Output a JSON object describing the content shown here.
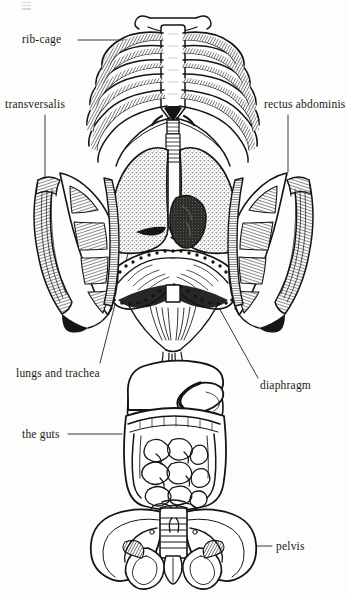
{
  "figure": {
    "kind": "anatomical-illustration",
    "background_color": "#fdfdfb",
    "ink_color": "#151513"
  },
  "labels": [
    {
      "id": "rib-cage",
      "text": "rib-cage",
      "x": 22,
      "y": 34,
      "leader": "horizontal-right"
    },
    {
      "id": "transversalis",
      "text": "transversalis",
      "x": 5,
      "y": 99,
      "leader": "vertical-down"
    },
    {
      "id": "rectus-abdominis",
      "text": "rectus abdominis",
      "x": 264,
      "y": 99,
      "leader": "vertical-down"
    },
    {
      "id": "lungs-and-trachea",
      "text": "lungs and trachea",
      "x": 16,
      "y": 368,
      "leader": "diagonal-up-right"
    },
    {
      "id": "diaphragm",
      "text": "diaphragm",
      "x": 260,
      "y": 380,
      "leader": "diagonal-up-left"
    },
    {
      "id": "the-guts",
      "text": "the guts",
      "x": 22,
      "y": 429,
      "leader": "horizontal-right"
    },
    {
      "id": "pelvis",
      "text": "pelvis",
      "x": 276,
      "y": 541,
      "leader": "horizontal-left"
    }
  ],
  "structures": [
    {
      "id": "rib-cage",
      "name": "rib cage with sternum",
      "region": "top"
    },
    {
      "id": "lungs",
      "name": "lungs, trachea and heart",
      "region": "upper-middle"
    },
    {
      "id": "diaphragm",
      "name": "diaphragm dome with crura",
      "region": "middle"
    },
    {
      "id": "transversalis",
      "name": "transversalis abdominal muscle sheet (left panel)",
      "region": "middle-left"
    },
    {
      "id": "rectus-abdominis",
      "name": "rectus abdominis muscle sheet (right panel)",
      "region": "middle-right"
    },
    {
      "id": "guts",
      "name": "liver, stomach and intestines",
      "region": "lower"
    },
    {
      "id": "pelvis",
      "name": "pelvic girdle with sacrum",
      "region": "bottom"
    }
  ]
}
